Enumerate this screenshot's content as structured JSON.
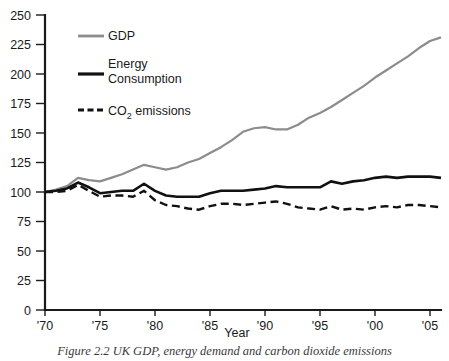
{
  "figure": {
    "caption": "Figure 2.2 UK GDP, energy demand and carbon dioxide emissions"
  },
  "chart_data": {
    "type": "line",
    "title": "",
    "xlabel": "Year",
    "ylabel": "",
    "xlim": [
      1970,
      2006
    ],
    "ylim": [
      0,
      250
    ],
    "grid": false,
    "legend_position": "upper-left-inside",
    "y_ticks": [
      0,
      25,
      50,
      75,
      100,
      125,
      150,
      175,
      200,
      225,
      250
    ],
    "y_tick_labels": [
      "0",
      "25",
      "50",
      "75",
      "100",
      "125",
      "150",
      "175",
      "200",
      "225",
      "250"
    ],
    "x_ticks": [
      1970,
      1975,
      1980,
      1985,
      1990,
      1995,
      2000,
      2005
    ],
    "x_tick_labels": [
      "'70",
      "'75",
      "'80",
      "'85",
      "'90",
      "'95",
      "'00",
      "'05"
    ],
    "x": [
      1970,
      1971,
      1972,
      1973,
      1974,
      1975,
      1976,
      1977,
      1978,
      1979,
      1980,
      1981,
      1982,
      1983,
      1984,
      1985,
      1986,
      1987,
      1988,
      1989,
      1990,
      1991,
      1992,
      1993,
      1994,
      1995,
      1996,
      1997,
      1998,
      1999,
      2000,
      2001,
      2002,
      2003,
      2004,
      2005,
      2006
    ],
    "series": [
      {
        "name": "GDP",
        "color": "#8c8c8c",
        "style": "solid",
        "width": 2.2,
        "values": [
          100,
          102,
          105,
          112,
          110,
          109,
          112,
          115,
          119,
          123,
          121,
          119,
          121,
          125,
          128,
          133,
          138,
          144,
          151,
          154,
          155,
          153,
          153,
          157,
          163,
          167,
          172,
          178,
          184,
          190,
          197,
          203,
          209,
          215,
          222,
          228,
          231
        ]
      },
      {
        "name": "Energy Consumption",
        "color": "#111111",
        "style": "solid",
        "width": 2.6,
        "values": [
          100,
          101,
          103,
          108,
          104,
          99,
          100,
          101,
          101,
          107,
          101,
          97,
          96,
          96,
          96,
          99,
          101,
          101,
          101,
          102,
          103,
          105,
          104,
          104,
          104,
          104,
          109,
          107,
          109,
          110,
          112,
          113,
          112,
          113,
          113,
          113,
          112
        ]
      },
      {
        "name": "CO2 emissions",
        "color": "#111111",
        "style": "dashed",
        "width": 2.4,
        "values": [
          100,
          100,
          101,
          106,
          101,
          96,
          97,
          97,
          96,
          101,
          93,
          89,
          88,
          86,
          85,
          88,
          90,
          90,
          89,
          90,
          91,
          92,
          90,
          87,
          86,
          85,
          88,
          85,
          86,
          85,
          87,
          88,
          87,
          89,
          89,
          88,
          87
        ]
      }
    ]
  },
  "legend": {
    "items": [
      {
        "label": "GDP",
        "label2": "",
        "swatch": "solid-gray"
      },
      {
        "label": "Energy",
        "label2": "Consumption",
        "swatch": "solid-black"
      },
      {
        "label": "CO",
        "sub": "2",
        "label2": " emissions",
        "swatch": "dashed-black"
      }
    ]
  }
}
